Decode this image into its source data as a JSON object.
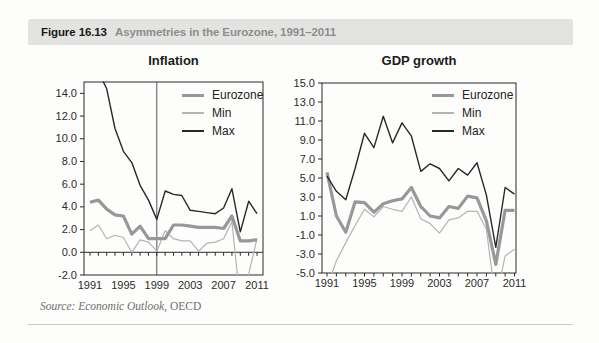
{
  "header": {
    "figure_label": "Figure 16.13",
    "subtitle": "Asymmetries in the Eurozone, 1991–2011",
    "bar_color": "#e3e3e2"
  },
  "source": {
    "italic_part": "Source: Economic Outlook,",
    "plain_part": " OECD"
  },
  "colors": {
    "eurozone_line": "#989898",
    "min_line": "#b4b4b4",
    "max_line": "#282828",
    "plot_border": "#2b2b2b",
    "tick_text": "#2b2b2b",
    "vline": "#444444"
  },
  "chart_data": [
    {
      "type": "line",
      "title": "Inflation",
      "x": [
        1991,
        1992,
        1993,
        1994,
        1995,
        1996,
        1997,
        1998,
        1999,
        2000,
        2001,
        2002,
        2003,
        2004,
        2005,
        2006,
        2007,
        2008,
        2009,
        2010,
        2011
      ],
      "ylim": [
        -2,
        15
      ],
      "y_ticks": [
        -2,
        0,
        2,
        4,
        6,
        8,
        10,
        12,
        14
      ],
      "x_tick_labels": [
        1991,
        1995,
        1999,
        2003,
        2007,
        2011
      ],
      "x_axis_at_zero": true,
      "vline_year": 1999,
      "grid": "off",
      "legend_position": "top-right",
      "series": [
        {
          "name": "Eurozone",
          "color": "#989898",
          "values": [
            4.4,
            4.6,
            3.8,
            3.3,
            3.2,
            1.6,
            2.3,
            1.2,
            1.2,
            1.2,
            2.4,
            2.4,
            2.3,
            2.2,
            2.2,
            2.2,
            2.1,
            3.2,
            1.0,
            1.0,
            1.1
          ]
        },
        {
          "name": "Min",
          "color": "#b4b4b4",
          "values": [
            1.9,
            2.4,
            1.2,
            1.5,
            1.3,
            0.0,
            1.1,
            0.9,
            0.1,
            1.9,
            1.2,
            1.0,
            1.0,
            0.1,
            0.8,
            0.9,
            1.2,
            2.7,
            -4.5,
            -1.9,
            1.2
          ]
        },
        {
          "name": "Max",
          "color": "#282828",
          "values": [
            19.5,
            15.9,
            14.4,
            10.9,
            8.9,
            7.9,
            5.9,
            4.6,
            2.9,
            5.4,
            5.1,
            5.0,
            3.7,
            3.6,
            3.5,
            3.4,
            3.9,
            5.6,
            1.8,
            4.5,
            3.4
          ]
        }
      ]
    },
    {
      "type": "line",
      "title": "GDP growth",
      "x": [
        1991,
        1992,
        1993,
        1994,
        1995,
        1996,
        1997,
        1998,
        1999,
        2000,
        2001,
        2002,
        2003,
        2004,
        2005,
        2006,
        2007,
        2008,
        2009,
        2010,
        2011
      ],
      "ylim": [
        -5,
        15
      ],
      "y_ticks": [
        -5,
        -3,
        -1,
        1,
        3,
        5,
        7,
        9,
        11,
        13,
        15
      ],
      "x_tick_labels": [
        1991,
        1995,
        1999,
        2003,
        2007,
        2011
      ],
      "x_axis_at_zero": false,
      "vline_year": null,
      "grid": "off",
      "legend_position": "top-right",
      "series": [
        {
          "name": "Eurozone",
          "color": "#989898",
          "values": [
            5.6,
            1.0,
            -0.7,
            2.5,
            2.4,
            1.4,
            2.3,
            2.6,
            2.8,
            4.0,
            2.0,
            1.0,
            0.8,
            2.0,
            1.8,
            3.1,
            2.9,
            0.5,
            -4.1,
            1.6,
            1.6
          ]
        },
        {
          "name": "Min",
          "color": "#b4b4b4",
          "values": [
            -6.5,
            -3.7,
            -1.8,
            0.0,
            1.7,
            0.9,
            2.0,
            1.7,
            1.5,
            3.0,
            0.7,
            0.2,
            -0.8,
            0.6,
            0.8,
            1.5,
            1.5,
            -0.4,
            -8.0,
            -3.2,
            -2.5
          ]
        },
        {
          "name": "Max",
          "color": "#282828",
          "values": [
            5.2,
            3.6,
            2.7,
            6.0,
            9.7,
            8.2,
            11.5,
            8.7,
            10.8,
            9.4,
            5.7,
            6.5,
            6.0,
            4.7,
            6.0,
            5.3,
            6.6,
            3.2,
            -2.3,
            4.0,
            3.3
          ]
        }
      ]
    }
  ]
}
